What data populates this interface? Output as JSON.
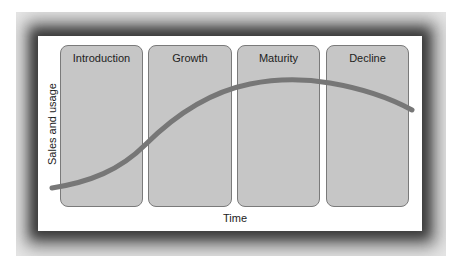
{
  "diagram": {
    "stages": [
      {
        "label": "Introduction"
      },
      {
        "label": "Growth"
      },
      {
        "label": "Maturity"
      },
      {
        "label": "Decline"
      }
    ],
    "y_axis_label": "Sales and usage",
    "x_axis_label": "Time",
    "colors": {
      "stage_fill": "#c6c6c6",
      "stage_border": "#7a7a7a",
      "curve": "#777777",
      "frame": "#6e6e6e"
    }
  }
}
